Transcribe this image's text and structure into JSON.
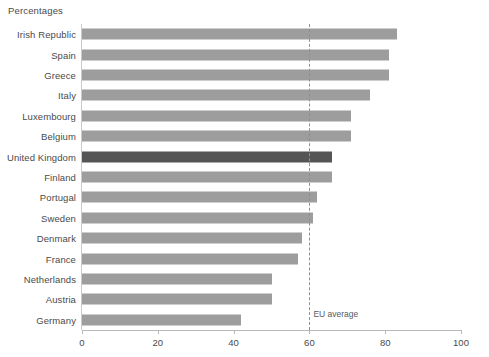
{
  "chart_data": {
    "type": "bar",
    "orientation": "horizontal",
    "title": "Percentages",
    "xlabel": "",
    "ylabel": "",
    "xlim": [
      0,
      100
    ],
    "xticks": [
      0,
      20,
      40,
      60,
      80,
      100
    ],
    "grid": false,
    "legend": null,
    "categories": [
      "Irish Republic",
      "Spain",
      "Greece",
      "Italy",
      "Luxembourg",
      "Belgium",
      "United Kingdom",
      "Finland",
      "Portugal",
      "Sweden",
      "Denmark",
      "France",
      "Netherlands",
      "Austria",
      "Germany"
    ],
    "values": [
      83,
      81,
      81,
      76,
      71,
      71,
      66,
      66,
      62,
      61,
      58,
      57,
      50,
      50,
      42
    ],
    "highlight_category": "United Kingdom",
    "annotations": [
      {
        "label": "EU average",
        "value": 60,
        "style": "dashed-vertical-line"
      }
    ],
    "colors": {
      "bar": "#9d9d9d",
      "bar_highlight": "#555555",
      "axis": "#b9b9b9",
      "text": "#4a4a4a",
      "reference_line": "#8f8f8f",
      "background": "#ffffff"
    }
  }
}
